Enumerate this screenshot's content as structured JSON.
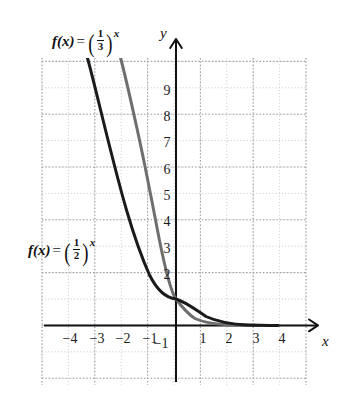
{
  "figure": {
    "title": "",
    "background": "#ffffff"
  },
  "chart_data": {
    "type": "line",
    "title": "",
    "xlabel": "x",
    "ylabel": "y",
    "xlim": [
      -5.1,
      5.0
    ],
    "ylim": [
      -2.4,
      10.4
    ],
    "grid": true,
    "grid_style": "dotted",
    "grid_major_every": 2,
    "legend_position": "inline-annotations",
    "axis_arrows": true,
    "xticks": [
      -4,
      -3,
      -2,
      -1,
      1,
      2,
      3,
      4
    ],
    "xtick_labels": [
      "-4",
      "-3",
      "-2",
      "-1",
      "1",
      "2",
      "3",
      "4"
    ],
    "yticks": [
      -1,
      2,
      3,
      4,
      5,
      6,
      7,
      8,
      9
    ],
    "ytick_labels": [
      "-1",
      "2",
      "3",
      "4",
      "5",
      "6",
      "7",
      "8",
      "9"
    ],
    "series": [
      {
        "name": "f(x) = (1/2)^x",
        "base": 0.5,
        "color": "#1a1a1a",
        "linewidth": 2.6,
        "x": [
          -3.35,
          -3.0,
          -2.5,
          -2.0,
          -1.5,
          -1.0,
          -0.5,
          0.0,
          0.5,
          1.0,
          1.5,
          2.0,
          2.5,
          3.0,
          3.4
        ],
        "y": [
          10.2,
          8.0,
          5.66,
          4.0,
          2.83,
          2.0,
          1.41,
          1.0,
          0.71,
          0.5,
          0.35,
          0.25,
          0.18,
          0.125,
          0.095
        ]
      },
      {
        "name": "f(x) = (1/3)^x",
        "base": 0.3333333,
        "color": "#6e6e6e",
        "linewidth": 2.6,
        "x": [
          -2.1,
          -2.0,
          -1.5,
          -1.0,
          -0.5,
          0.0,
          0.5,
          1.0,
          1.5,
          2.0,
          2.5,
          3.0
        ],
        "y": [
          10.4,
          9.0,
          5.196,
          3.0,
          1.732,
          1.0,
          0.577,
          0.333,
          0.192,
          0.111,
          0.064,
          0.037
        ]
      }
    ],
    "annotations": [
      {
        "text": "f(x) = (1/3)^x",
        "for_series": "f(x) = (1/3)^x",
        "position": "top-left"
      },
      {
        "text": "f(x) = (1/2)^x",
        "for_series": "f(x) = (1/2)^x",
        "position": "mid-left"
      }
    ]
  },
  "labels": {
    "fn1": {
      "name": "f",
      "arg": "(x)",
      "eq": "=",
      "num": "1",
      "den": "3",
      "exp": "x"
    },
    "fn2": {
      "name": "f",
      "arg": "(x)",
      "eq": "=",
      "num": "1",
      "den": "2",
      "exp": "x"
    },
    "y_axis": "y",
    "x_axis": "x"
  },
  "ticks": {
    "y": [
      {
        "value": "9",
        "px": 92
      },
      {
        "value": "8",
        "px": 118
      },
      {
        "value": "7",
        "px": 144
      },
      {
        "value": "6",
        "px": 171
      },
      {
        "value": "5",
        "px": 197
      },
      {
        "value": "4",
        "px": 223
      },
      {
        "value": "3",
        "px": 250
      },
      {
        "value": "2",
        "px": 276
      },
      {
        "value": "−1",
        "px": 345
      }
    ],
    "x": [
      {
        "value": "−4",
        "px": 70
      },
      {
        "value": "−3",
        "px": 97
      },
      {
        "value": "−2",
        "px": 123
      },
      {
        "value": "−1",
        "px": 150
      },
      {
        "value": "1",
        "px": 203
      },
      {
        "value": "2",
        "px": 229
      },
      {
        "value": "3",
        "px": 256
      },
      {
        "value": "4",
        "px": 282
      }
    ]
  },
  "colors": {
    "curve_half": "#1a1a1a",
    "curve_third": "#6e6e6e",
    "axis": "#111111",
    "grid_minor": "#c9c9c9",
    "grid_major": "#a8a8a8",
    "text": "#111111"
  }
}
